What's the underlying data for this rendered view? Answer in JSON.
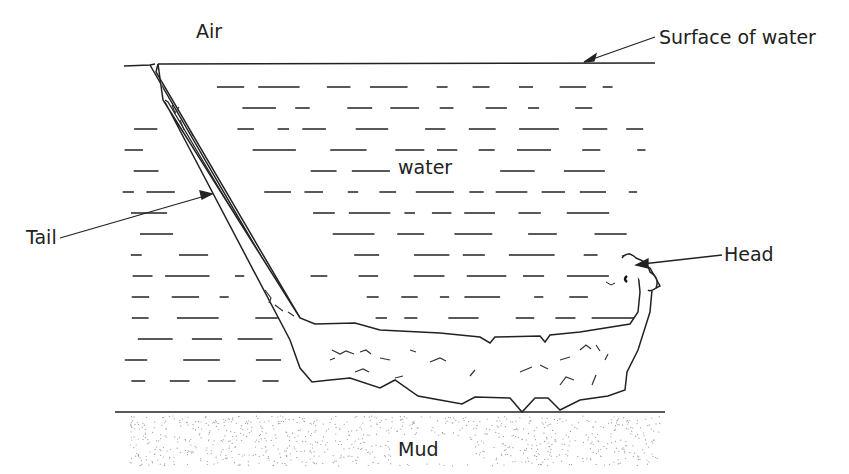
{
  "diagram": {
    "type": "labelled biological illustration",
    "labels": {
      "air": "Air",
      "surface": "Surface of water",
      "water": "water",
      "tail": "Tail",
      "head": "Head",
      "mud": "Mud"
    },
    "colors": {
      "line": "#222222",
      "background": "#ffffff",
      "mud_dots": "#999999"
    }
  }
}
